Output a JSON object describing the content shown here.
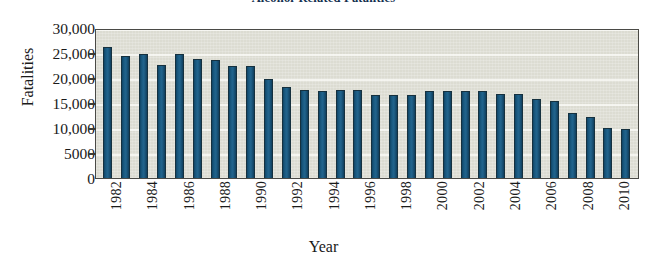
{
  "chart_data": {
    "type": "bar",
    "title": "Alcohol-Related Fatalities",
    "xlabel": "Year",
    "ylabel": "Fatalities",
    "ylim": [
      0,
      30000
    ],
    "yticks": [
      0,
      5000,
      10000,
      15000,
      20000,
      25000,
      30000
    ],
    "ytick_labels": [
      "0",
      "5000",
      "10,000",
      "15,000",
      "20,000",
      "25,000",
      "30,000"
    ],
    "xtick_labels": [
      "1982",
      "1984",
      "1986",
      "1988",
      "1990",
      "1992",
      "1994",
      "1996",
      "1998",
      "2000",
      "2002",
      "2004",
      "2006",
      "2008",
      "2010"
    ],
    "grid": true,
    "legend": null,
    "bar_color": "#1b5b82",
    "plot_background": "#dcdcd2",
    "categories": [
      "1982",
      "1983",
      "1984",
      "1985",
      "1986",
      "1987",
      "1988",
      "1989",
      "1990",
      "1991",
      "1992",
      "1993",
      "1994",
      "1995",
      "1996",
      "1997",
      "1998",
      "1999",
      "2000",
      "2001",
      "2002",
      "2003",
      "2004",
      "2005",
      "2006",
      "2007",
      "2008",
      "2009",
      "2010",
      "2011"
    ],
    "values": [
      26200,
      24500,
      24800,
      22600,
      24800,
      23900,
      23600,
      22400,
      22500,
      19800,
      18200,
      17700,
      17400,
      17600,
      17700,
      16700,
      16700,
      16700,
      17500,
      17500,
      17500,
      17500,
      16900,
      16800,
      15800,
      15400,
      13100,
      12200,
      10100,
      9900
    ]
  },
  "figure": {
    "title": "Alcohol-Related Fatalities",
    "y_axis_title": "Fatalities",
    "x_axis_title": "Year"
  }
}
